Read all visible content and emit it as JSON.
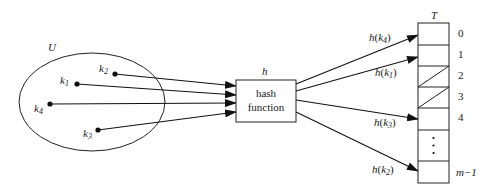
{
  "diagram": {
    "type": "hash-table-mapping",
    "universe": {
      "label": "U",
      "keys": [
        {
          "name": "k",
          "sub": "1",
          "x": 77,
          "y": 84
        },
        {
          "name": "k",
          "sub": "2",
          "x": 115,
          "y": 74
        },
        {
          "name": "k",
          "sub": "3",
          "x": 98,
          "y": 130
        },
        {
          "name": "k",
          "sub": "4",
          "x": 50,
          "y": 104
        }
      ]
    },
    "hash_box": {
      "label_above": "h",
      "line1": "hash",
      "line2": "function"
    },
    "table": {
      "label": "T",
      "slots": [
        {
          "index": "0",
          "state": "empty"
        },
        {
          "index": "1",
          "state": "empty"
        },
        {
          "index": "2",
          "state": "nil"
        },
        {
          "index": "3",
          "state": "nil"
        },
        {
          "index": "4",
          "state": "empty"
        },
        {
          "index": "",
          "state": "ellipsis"
        },
        {
          "index": "m−1",
          "state": "empty"
        }
      ]
    },
    "mappings": [
      {
        "label": "h",
        "key": "k",
        "sub": "4",
        "slot": "0"
      },
      {
        "label": "h",
        "key": "k",
        "sub": "1",
        "slot": "1"
      },
      {
        "label": "h",
        "key": "k",
        "sub": "3",
        "slot": "4"
      },
      {
        "label": "h",
        "key": "k",
        "sub": "2",
        "slot": "m−1"
      }
    ]
  }
}
